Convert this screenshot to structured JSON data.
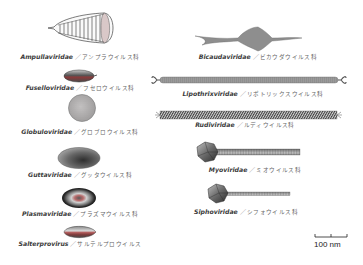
{
  "figure": {
    "scale_bar": {
      "label": "100 nm"
    },
    "viruses": [
      {
        "id": "ampullaviridae",
        "scientific": "Ampullaviridae",
        "separator": "／",
        "japanese": "アンプラウイルス科",
        "shape": "bottle"
      },
      {
        "id": "fuselloviridae",
        "scientific": "Fuselloviridae",
        "separator": "／",
        "japanese": "フセロウイルス科",
        "shape": "spindle"
      },
      {
        "id": "globuloviridae",
        "scientific": "Globuloviridae",
        "separator": "／",
        "japanese": "グロブロウイルス科",
        "shape": "sphere"
      },
      {
        "id": "guttaviridae",
        "scientific": "Guttaviridae",
        "separator": "／",
        "japanese": "グッタウイルス科",
        "shape": "droplet"
      },
      {
        "id": "plasmaviridae",
        "scientific": "Plasmaviridae",
        "separator": "／",
        "japanese": "プラズマウイルス科",
        "shape": "pleomorphic"
      },
      {
        "id": "salterprovirus",
        "scientific": "Salterprovirus",
        "separator": "／",
        "japanese": "サルテルプロウイルス",
        "shape": "spindle-short"
      },
      {
        "id": "bicaudaviridae",
        "scientific": "Bicaudaviridae",
        "separator": "／",
        "japanese": "ビカウダウイルス科",
        "shape": "two-tailed-spindle"
      },
      {
        "id": "lipothrixviridae",
        "scientific": "Lipothrixviridae",
        "separator": "／",
        "japanese": "リポトリックスウイルス科",
        "shape": "filament"
      },
      {
        "id": "rudiviridae",
        "scientific": "Rudiviridae",
        "separator": "／",
        "japanese": "ルディウイルス科",
        "shape": "rod"
      },
      {
        "id": "myoviridae",
        "scientific": "Myoviridae",
        "separator": "／",
        "japanese": "ミオウイルス科",
        "shape": "head-contractile-tail"
      },
      {
        "id": "siphoviridae",
        "scientific": "Siphoviridae",
        "separator": "／",
        "japanese": "シフォウイルス科",
        "shape": "head-long-tail"
      }
    ]
  },
  "colors": {
    "outline": "#4a4a4a",
    "fill_light": "#c8c8c8",
    "fill_mid": "#9a9a9a",
    "fill_dark": "#5a5a5a",
    "accent_red": "#a04848",
    "text": "#333333"
  }
}
